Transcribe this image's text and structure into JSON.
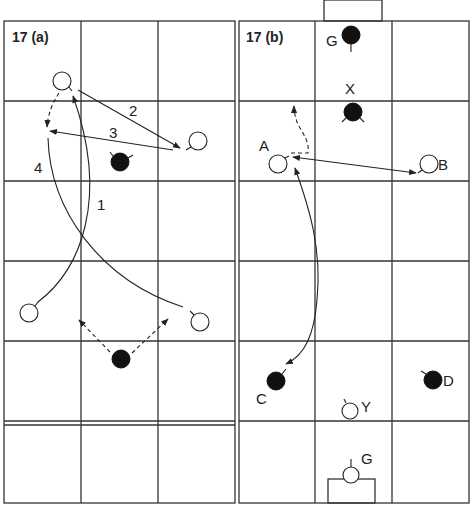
{
  "figure": {
    "panels": [
      {
        "id": "a",
        "label": "17 (a)",
        "path_labels": [
          "1",
          "2",
          "3",
          "4"
        ]
      },
      {
        "id": "b",
        "label": "17 (b)",
        "player_labels": {
          "goalkeeper_top": "G",
          "defender_x": "X",
          "attacker_a": "A",
          "attacker_b": "B",
          "attacker_c": "C",
          "attacker_d": "D",
          "defender_y": "Y",
          "goalkeeper_bottom": "G"
        }
      }
    ],
    "legend": {
      "open_circle": "player (team 1)",
      "filled_circle": "player (team 2)",
      "solid_arrow": "pass / movement",
      "dashed_arrow": "run"
    }
  }
}
